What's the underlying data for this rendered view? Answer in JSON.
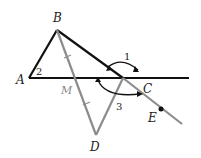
{
  "diagram": {
    "points": {
      "A": {
        "label": "A",
        "x": 29,
        "y": 78
      },
      "B": {
        "label": "B",
        "x": 57,
        "y": 30
      },
      "C": {
        "label": "C",
        "x": 123,
        "y": 78
      },
      "D": {
        "label": "D",
        "x": 96,
        "y": 135
      },
      "E": {
        "label": "E",
        "x": 161,
        "y": 110
      },
      "M": {
        "label": "M",
        "x": 77,
        "y": 78
      }
    },
    "angles": {
      "angle1": {
        "label": "1"
      },
      "angle2": {
        "label": "2"
      },
      "angle3": {
        "label": "3"
      }
    },
    "colors": {
      "black_line": "#111111",
      "gray_line": "#8c8c8c"
    }
  }
}
